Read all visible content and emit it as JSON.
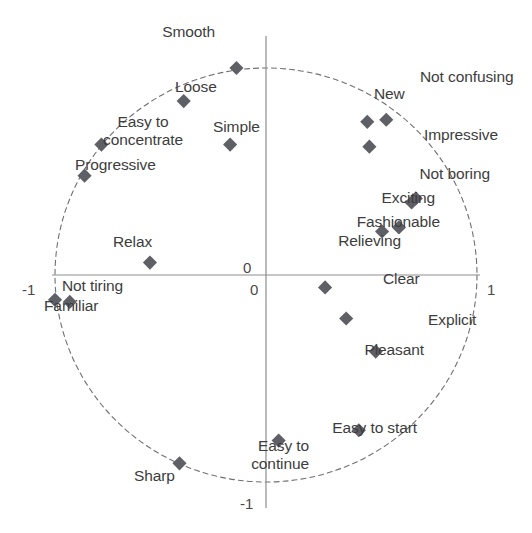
{
  "chart_data": {
    "type": "scatter",
    "title": "",
    "subtitle": "",
    "xlabel": "",
    "ylabel": "",
    "xlim": [
      -1,
      1
    ],
    "ylim": [
      -1,
      1
    ],
    "grid": false,
    "legend": "none",
    "unit_circle": true,
    "axis_ticks": {
      "x": [
        {
          "value": -1,
          "label": "-1"
        },
        {
          "value": 0,
          "label": "0"
        },
        {
          "value": 1,
          "label": "1"
        }
      ],
      "y": [
        {
          "value": -1,
          "label": "-1"
        },
        {
          "value": 0,
          "label": "0"
        },
        {
          "value": 1,
          "label": "1"
        }
      ]
    },
    "marker": {
      "shape": "diamond",
      "color": "#5f5f66",
      "size": 10
    },
    "points": [
      {
        "label": "Smooth",
        "x": -0.14,
        "y": 1.0,
        "label_pos": "left"
      },
      {
        "label": "Loose",
        "x": -0.39,
        "y": 0.84,
        "label_pos": "right"
      },
      {
        "label": "Easy to\nconcentrate",
        "x": -0.78,
        "y": 0.63,
        "label_pos": "right"
      },
      {
        "label": "Simple",
        "x": -0.17,
        "y": 0.63,
        "label_pos": "right"
      },
      {
        "label": "Progressive",
        "x": -0.86,
        "y": 0.48,
        "label_pos": "right"
      },
      {
        "label": "Relax",
        "x": -0.55,
        "y": 0.06,
        "label_pos": "top"
      },
      {
        "label": "Not tiring",
        "x": -0.93,
        "y": -0.13,
        "label_pos": "right"
      },
      {
        "label": "Familiar",
        "x": -1.0,
        "y": -0.12,
        "label_pos": "below"
      },
      {
        "label": "Sharp",
        "x": -0.41,
        "y": -0.91,
        "label_pos": "below"
      },
      {
        "label": "Easy to\ncontinue",
        "x": 0.06,
        "y": -0.8,
        "label_pos": "left"
      },
      {
        "label": "Easy to start",
        "x": 0.44,
        "y": -0.75,
        "label_pos": "left"
      },
      {
        "label": "Pleasant",
        "x": 0.52,
        "y": -0.37,
        "label_pos": "left"
      },
      {
        "label": "Explicit",
        "x": 0.38,
        "y": -0.21,
        "label_pos": "belowright"
      },
      {
        "label": "Clear",
        "x": 0.28,
        "y": -0.06,
        "label_pos": "right"
      },
      {
        "label": "Relieving",
        "x": 0.55,
        "y": 0.21,
        "label_pos": "belowleft"
      },
      {
        "label": "Fashionable",
        "x": 0.63,
        "y": 0.23,
        "label_pos": "aboveleft"
      },
      {
        "label": "Exciting",
        "x": 0.69,
        "y": 0.35,
        "label_pos": "left"
      },
      {
        "label": "Not boring",
        "x": 0.71,
        "y": 0.37,
        "label_pos": "aboveleft"
      },
      {
        "label": "Impressive",
        "x": 0.49,
        "y": 0.62,
        "label_pos": "right"
      },
      {
        "label": "New",
        "x": 0.48,
        "y": 0.74,
        "label_pos": "above"
      },
      {
        "label": "Not confusing",
        "x": 0.57,
        "y": 0.75,
        "label_pos": "aboveright"
      }
    ]
  },
  "axis": {
    "x_zero_label": "0",
    "y_zero_label": "0",
    "x_min_label": "-1",
    "x_max_label": "1",
    "y_min_label": "-1",
    "y_max_label": "1"
  },
  "labels": {
    "smooth": "Smooth",
    "loose": "Loose",
    "easy_to_concentrate_1": "Easy to",
    "easy_to_concentrate_2": "concentrate",
    "simple": "Simple",
    "progressive": "Progressive",
    "relax": "Relax",
    "not_tiring": "Not tiring",
    "familiar": "Familiar",
    "sharp": "Sharp",
    "easy_to_continue_1": "Easy to",
    "easy_to_continue_2": "continue",
    "easy_to_start": "Easy to start",
    "pleasant": "Pleasant",
    "explicit": "Explicit",
    "clear": "Clear",
    "relieving": "Relieving",
    "fashionable": "Fashionable",
    "exciting": "Exciting",
    "not_boring": "Not boring",
    "impressive": "Impressive",
    "new": "New",
    "not_confusing": "Not confusing"
  },
  "colors": {
    "marker": "#5f5f66",
    "axis": "#8d8d8d",
    "circle": "#6f6f6f",
    "text": "#3d3d3d",
    "background": "#ffffff"
  }
}
